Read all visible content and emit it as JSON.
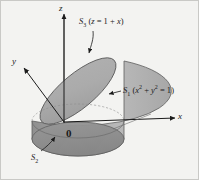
{
  "figure": {
    "background_color": "#f3f3f1",
    "border_color": "#c9c9c6",
    "ink_color": "#1b1b1b"
  },
  "axes": {
    "z": {
      "label": "z",
      "direction": "up"
    },
    "y": {
      "label": "y",
      "direction": "up-left"
    },
    "x": {
      "label": "x",
      "direction": "right"
    },
    "origin": {
      "label": "0"
    }
  },
  "surfaces": [
    {
      "id": "S3",
      "name": "slanted-top-plane",
      "symbol": "S",
      "subscript": "3",
      "equation_open": "(",
      "equation_var": "z",
      "equation_eq": " = 1 + ",
      "equation_var2": "x",
      "equation_close": ")",
      "full_text": "S3 (z = 1 + x)",
      "fill_color": "#a8a8a8"
    },
    {
      "id": "S1",
      "name": "cylinder-lateral-surface",
      "symbol": "S",
      "subscript": "1",
      "equation_open": "(",
      "equation_var": "x",
      "equation_sup": "2",
      "equation_plus": " + ",
      "equation_var2": "y",
      "equation_sup2": "2",
      "equation_eq": " = 1",
      "equation_close": ")",
      "full_text": "S1 (x2 + y2 = 1)",
      "fill_color": "#b5b5b5"
    },
    {
      "id": "S2",
      "name": "bottom-disk",
      "symbol": "S",
      "subscript": "2",
      "full_text": "S2",
      "fill_color": "#8e8e8e"
    }
  ],
  "shading": {
    "top_ellipse": "#a8a8a8",
    "lateral_right": "#b5b5b5",
    "lateral_left": "#9a9a9a",
    "bottom_disk": "#8e8e8e",
    "outline": "#5a5a5a"
  }
}
